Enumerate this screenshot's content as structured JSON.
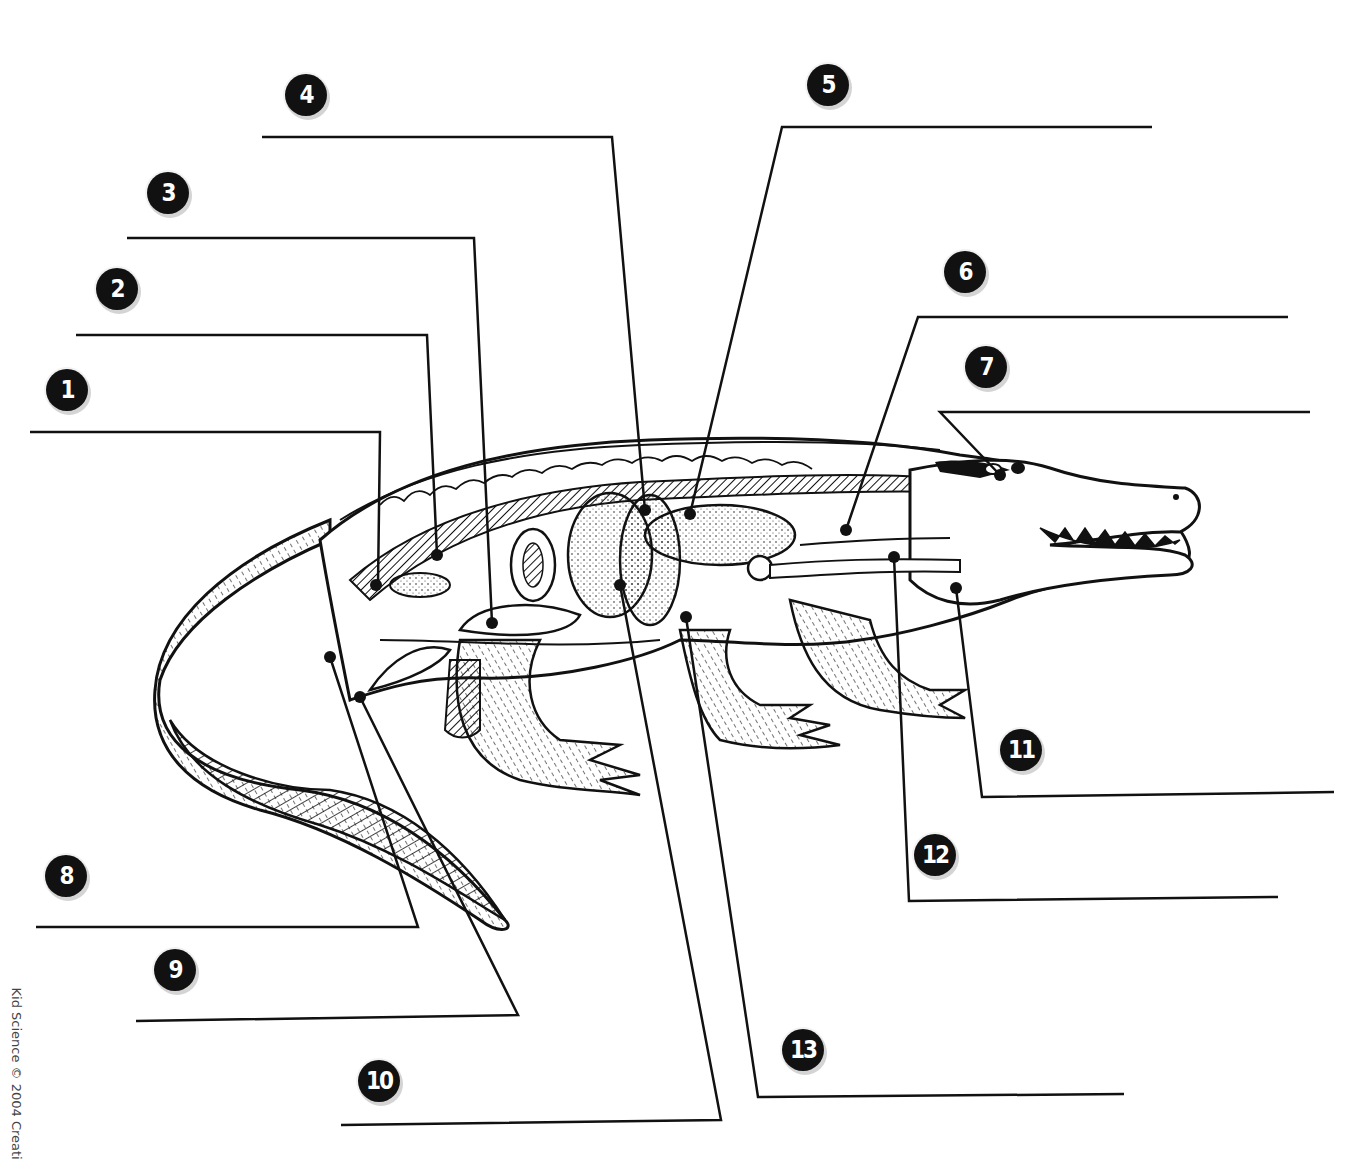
{
  "diagram": {
    "copyright_side_text": "Kid Science © 2004 Creati",
    "colors": {
      "ink": "#111111",
      "badge_fill": "#111111",
      "badge_text": "#ffffff",
      "badge_shadow": "#d4d4d4",
      "background": "#ffffff"
    }
  },
  "labels": [
    {
      "number": "1",
      "badge": [
        67,
        390
      ],
      "line": [
        [
          30,
          432
        ],
        [
          380,
          432
        ],
        [
          378,
          585
        ]
      ],
      "dot": [
        376,
        585
      ]
    },
    {
      "number": "2",
      "badge": [
        117,
        289
      ],
      "line": [
        [
          76,
          335
        ],
        [
          427,
          335
        ],
        [
          437,
          555
        ]
      ],
      "dot": [
        437,
        555
      ]
    },
    {
      "number": "3",
      "badge": [
        168,
        193
      ],
      "line": [
        [
          127,
          238
        ],
        [
          474,
          238
        ],
        [
          492,
          623
        ]
      ],
      "dot": [
        492,
        623
      ]
    },
    {
      "number": "4",
      "badge": [
        306,
        95
      ],
      "line": [
        [
          262,
          137
        ],
        [
          612,
          137
        ],
        [
          645,
          510
        ]
      ],
      "dot": [
        645,
        510
      ]
    },
    {
      "number": "5",
      "badge": [
        828,
        85
      ],
      "line": [
        [
          1152,
          127
        ],
        [
          782,
          127
        ],
        [
          690,
          514
        ]
      ],
      "dot": [
        690,
        514
      ]
    },
    {
      "number": "6",
      "badge": [
        965,
        272
      ],
      "line": [
        [
          1288,
          317
        ],
        [
          918,
          317
        ],
        [
          846,
          530
        ]
      ],
      "dot": [
        846,
        530
      ]
    },
    {
      "number": "7",
      "badge": [
        986,
        367
      ],
      "line": [
        [
          1310,
          412
        ],
        [
          940,
          412
        ],
        [
          1000,
          475
        ]
      ],
      "dot": [
        1000,
        475
      ]
    },
    {
      "number": "8",
      "badge": [
        66,
        876
      ],
      "line": [
        [
          36,
          927
        ],
        [
          418,
          927
        ],
        [
          330,
          657
        ]
      ],
      "dot": [
        330,
        657
      ]
    },
    {
      "number": "9",
      "badge": [
        175,
        970
      ],
      "line": [
        [
          136,
          1021
        ],
        [
          518,
          1015
        ],
        [
          360,
          697
        ]
      ],
      "dot": [
        360,
        697
      ]
    },
    {
      "number": "10",
      "badge": [
        379,
        1081
      ],
      "line": [
        [
          341,
          1125
        ],
        [
          721,
          1120
        ],
        [
          620,
          585
        ]
      ],
      "dot": [
        620,
        585
      ]
    },
    {
      "number": "11",
      "badge": [
        1021,
        750
      ],
      "line": [
        [
          1334,
          792
        ],
        [
          982,
          797
        ],
        [
          956,
          588
        ]
      ],
      "dot": [
        956,
        588
      ]
    },
    {
      "number": "12",
      "badge": [
        935,
        855
      ],
      "line": [
        [
          1278,
          897
        ],
        [
          909,
          901
        ],
        [
          894,
          557
        ]
      ],
      "dot": [
        894,
        557
      ]
    },
    {
      "number": "13",
      "badge": [
        803,
        1050
      ],
      "line": [
        [
          1124,
          1094
        ],
        [
          758,
          1097
        ],
        [
          686,
          617
        ]
      ],
      "dot": [
        686,
        617
      ]
    }
  ]
}
